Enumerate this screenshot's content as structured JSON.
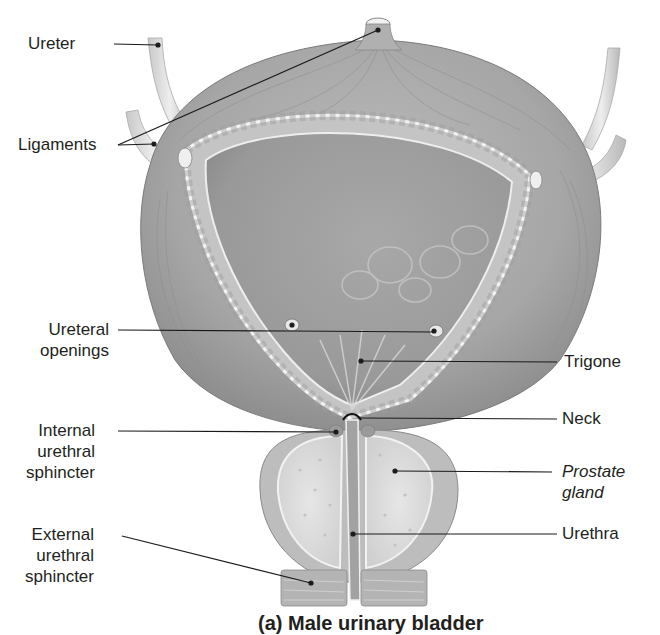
{
  "figure": {
    "caption_partial": "(a) Male urinary bladder"
  },
  "labels": {
    "ureter": "Ureter",
    "ligaments": "Ligaments",
    "ureteral_openings_1": "Ureteral",
    "ureteral_openings_2": "openings",
    "trigone": "Trigone",
    "neck": "Neck",
    "internal_sphincter_1": "Internal",
    "internal_sphincter_2": "urethral",
    "internal_sphincter_3": "sphincter",
    "prostate_1": "Prostate",
    "prostate_2": "gland",
    "external_sphincter_1": "External",
    "external_sphincter_2": "urethral",
    "external_sphincter_3": "sphincter",
    "urethra": "Urethra"
  },
  "colors": {
    "muscle": "#a9a9a9",
    "muscle_dark": "#8c8c8c",
    "wall": "#b5b5b5",
    "lumen": "#9a9a9a",
    "prostate": "#dcdcdc",
    "leader": "#1a1a1a"
  }
}
